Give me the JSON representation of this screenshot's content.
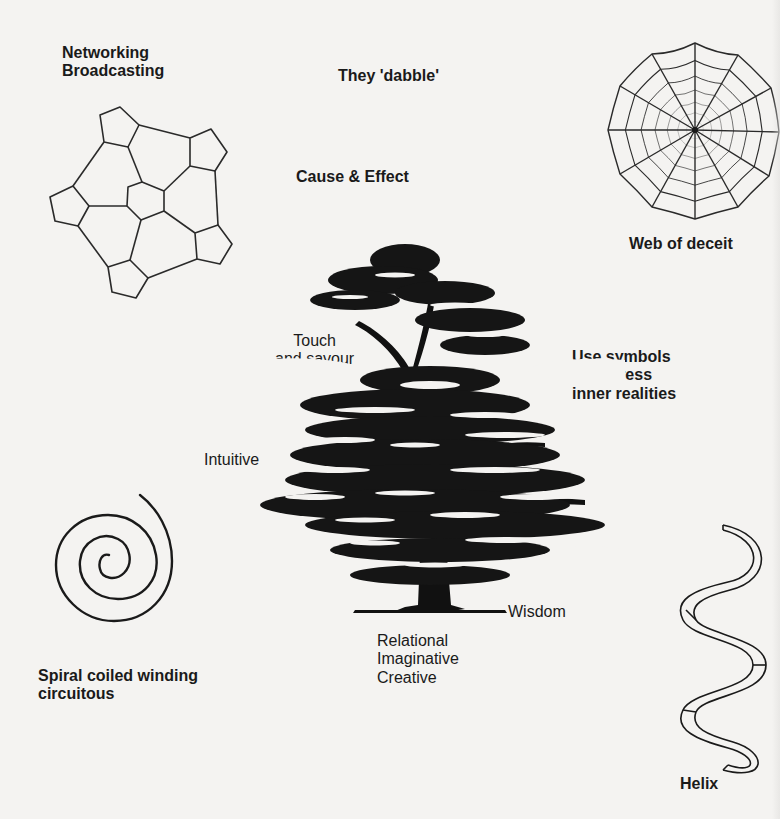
{
  "labels": {
    "networking": [
      "Networking",
      "Broadcasting"
    ],
    "dabble": "They 'dabble'",
    "cause_effect": "Cause & Effect",
    "web": "Web of deceit",
    "touch": [
      "Touch",
      "and savour"
    ],
    "symbols": [
      "Use symbols",
      "to express",
      "inner realities"
    ],
    "intuitive": "Intuitive",
    "wisdom": "Wisdom",
    "relational": [
      "Relational",
      "Imaginative",
      "Creative"
    ],
    "spiral": [
      "Spiral coiled winding",
      "circuitous"
    ],
    "helix": "Helix"
  },
  "figures": {
    "network": "pentagon-network",
    "web": "spider-web",
    "tree": "cedar-tree",
    "spiral": "spiral",
    "helix": "helix-ribbon"
  },
  "colors": {
    "background": "#f4f3f1",
    "ink": "#1a1a1a"
  }
}
